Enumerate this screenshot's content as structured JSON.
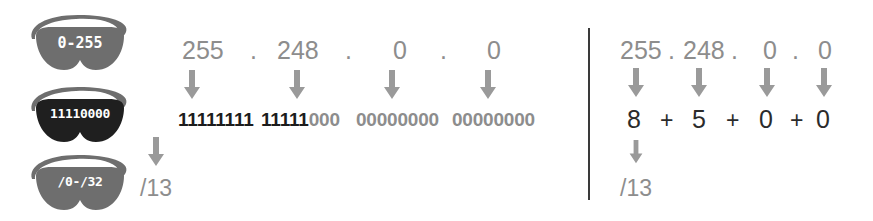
{
  "diagram": {
    "background_color": "#ffffff",
    "divider_color": "#3a3a3a"
  },
  "icons": {
    "range_goggles": {
      "name": "goggles-icon-decimal-range",
      "label": "0-255",
      "fill": "#6e6e6e",
      "strap_color": "#6e6e6e"
    },
    "binary_goggles": {
      "name": "goggles-icon-binary",
      "label": "11110000",
      "fill": "#1f1f1f",
      "strap_color": "#6e6e6e"
    },
    "prefix_goggles": {
      "name": "goggles-icon-prefix",
      "label": "/0-/32",
      "fill": "#6e6e6e",
      "strap_color": "#6e6e6e"
    }
  },
  "left_panel": {
    "name": "binary-expansion-panel",
    "mask_octets": [
      "255",
      "248",
      "0",
      "0"
    ],
    "separator": ".",
    "binary_octets": [
      {
        "on_bits": "11111111",
        "off_bits": ""
      },
      {
        "on_bits": "11111",
        "off_bits": "000"
      },
      {
        "on_bits": "",
        "off_bits": "00000000"
      },
      {
        "on_bits": "",
        "off_bits": "00000000"
      }
    ],
    "result_prefix": "/13",
    "colors": {
      "decimal": "#8d8d8d",
      "bit_on": "#1c1c1c",
      "bit_off": "#8d8d8d",
      "arrow": "#9a9a9a",
      "result": "#8d8d8d"
    }
  },
  "right_panel": {
    "name": "bit-count-addition-panel",
    "mask_octets": [
      "255",
      "248",
      "0",
      "0"
    ],
    "separator": ".",
    "bit_counts": [
      "8",
      "5",
      "0",
      "0"
    ],
    "operator": "+",
    "result_prefix": "/13",
    "colors": {
      "decimal": "#8d8d8d",
      "sum": "#2b2b2b",
      "arrow": "#9a9a9a",
      "result": "#8d8d8d"
    }
  }
}
